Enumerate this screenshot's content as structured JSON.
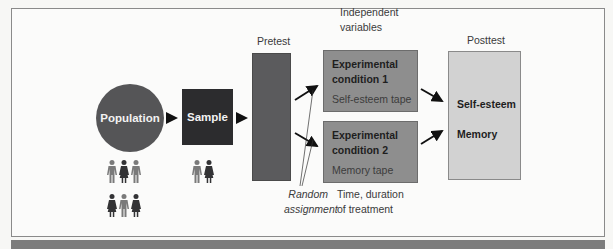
{
  "diagram": {
    "population": {
      "label": "Population",
      "color": "#555557"
    },
    "sample": {
      "label": "Sample",
      "color": "#2c2c2e"
    },
    "pretest": {
      "label": "Pretest",
      "color": "#5b5b5d"
    },
    "independent_variables": {
      "line1": "Independent",
      "line2": "variables"
    },
    "conditions": [
      {
        "title_line1": "Experimental",
        "title_line2": "condition 1",
        "treatment": "Self-esteem tape"
      },
      {
        "title_line1": "Experimental",
        "title_line2": "condition 2",
        "treatment": "Memory tape"
      }
    ],
    "posttest": {
      "label": "Posttest",
      "measures": [
        "Self-esteem",
        "Memory"
      ],
      "color": "#d2d2d2"
    },
    "random_assignment": {
      "line1": "Random",
      "line2": "assignment"
    },
    "treatment_time": {
      "line1": "Time, duration",
      "line2": "of treatment"
    },
    "people_icons": {
      "population_row1": [
        "man",
        "woman",
        "man"
      ],
      "population_row2": [
        "woman",
        "man",
        "woman"
      ],
      "sample_row": [
        "man",
        "woman"
      ],
      "man_color": "#7a7a7a",
      "woman_color": "#333335"
    }
  }
}
